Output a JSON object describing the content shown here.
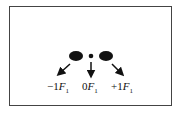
{
  "diagram": {
    "type": "diffraction-orders",
    "orders": [
      {
        "label_prefix": "−1",
        "symbol": "F",
        "subscript": "1",
        "spot": "large",
        "direction": "down-left"
      },
      {
        "label_prefix": "0",
        "symbol": "F",
        "subscript": "1",
        "spot": "small",
        "direction": "down"
      },
      {
        "label_prefix": "+1",
        "symbol": "F",
        "subscript": "1",
        "spot": "large",
        "direction": "down-right"
      }
    ]
  }
}
